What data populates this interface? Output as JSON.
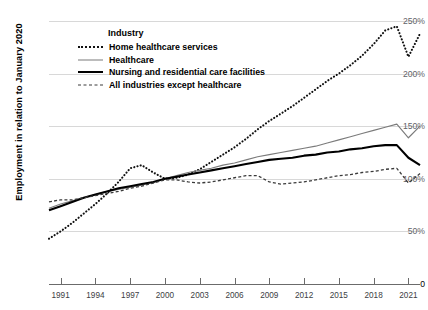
{
  "chart_data": {
    "type": "line",
    "title": "",
    "xlabel": "",
    "ylabel": "Employment in relation to January 2020",
    "legend_title": "Industry",
    "legend_position": "inside-top-left",
    "grid": true,
    "xlim": [
      1990,
      2022
    ],
    "ylim": [
      0,
      250
    ],
    "ytick_labels": [
      "0",
      "50%",
      "100%",
      "150%",
      "200%",
      "250%"
    ],
    "ytick_values": [
      0,
      50,
      100,
      150,
      200,
      250
    ],
    "xtick_labels": [
      "1991",
      "1994",
      "1997",
      "2000",
      "2003",
      "2006",
      "2009",
      "2012",
      "2015",
      "2018",
      "2021"
    ],
    "xtick_values": [
      1991,
      1994,
      1997,
      2000,
      2003,
      2006,
      2009,
      2012,
      2015,
      2018,
      2021
    ],
    "x": [
      1990,
      1991,
      1992,
      1993,
      1994,
      1995,
      1996,
      1997,
      1998,
      1999,
      2000,
      2001,
      2002,
      2003,
      2004,
      2005,
      2006,
      2007,
      2008,
      2009,
      2010,
      2011,
      2012,
      2013,
      2014,
      2015,
      2016,
      2017,
      2018,
      2019,
      2020,
      2021,
      2022
    ],
    "series": [
      {
        "name": "Home healthcare services",
        "style": "dotted",
        "color": "#111111",
        "width": 2.1,
        "values": [
          43,
          50,
          58,
          67,
          76,
          86,
          97,
          110,
          113,
          106,
          100,
          101,
          104,
          109,
          116,
          123,
          130,
          138,
          147,
          155,
          162,
          169,
          177,
          185,
          193,
          200,
          208,
          217,
          228,
          241,
          245,
          216,
          238
        ]
      },
      {
        "name": "Healthcare",
        "style": "solid",
        "color": "#7b7b7b",
        "width": 1.15,
        "values": [
          72,
          76,
          79,
          82,
          85,
          88,
          90,
          92,
          94,
          97,
          100,
          103,
          106,
          108,
          110,
          113,
          115,
          118,
          121,
          123,
          125,
          127,
          129,
          131,
          134,
          137,
          140,
          143,
          146,
          149,
          152,
          139,
          150
        ]
      },
      {
        "name": "Nursing and residential care facilities",
        "style": "solid",
        "color": "#000000",
        "width": 2.1,
        "values": [
          70,
          74,
          78,
          82,
          85,
          88,
          91,
          93,
          95,
          97,
          100,
          102,
          104,
          106,
          108,
          110,
          112,
          114,
          116,
          118,
          119,
          120,
          122,
          123,
          125,
          126,
          128,
          129,
          131,
          132,
          132,
          120,
          113
        ]
      },
      {
        "name": "All industries except healthcare",
        "style": "dashed",
        "color": "#3a3a3a",
        "width": 1.3,
        "values": [
          78,
          80,
          80,
          82,
          84,
          86,
          88,
          91,
          93,
          96,
          99,
          99,
          97,
          96,
          97,
          99,
          101,
          103,
          103,
          97,
          95,
          96,
          97,
          99,
          101,
          103,
          104,
          106,
          107,
          109,
          110,
          96,
          105
        ]
      }
    ]
  },
  "legend": {
    "title": "Industry",
    "items": [
      {
        "label": "Home healthcare services",
        "swatch": "dotted-line-icon"
      },
      {
        "label": "Healthcare",
        "swatch": "solid-thin-line-icon"
      },
      {
        "label": "Nursing and residential care facilities",
        "swatch": "solid-thick-line-icon"
      },
      {
        "label": "All industries except healthcare",
        "swatch": "dashed-line-icon"
      }
    ]
  }
}
